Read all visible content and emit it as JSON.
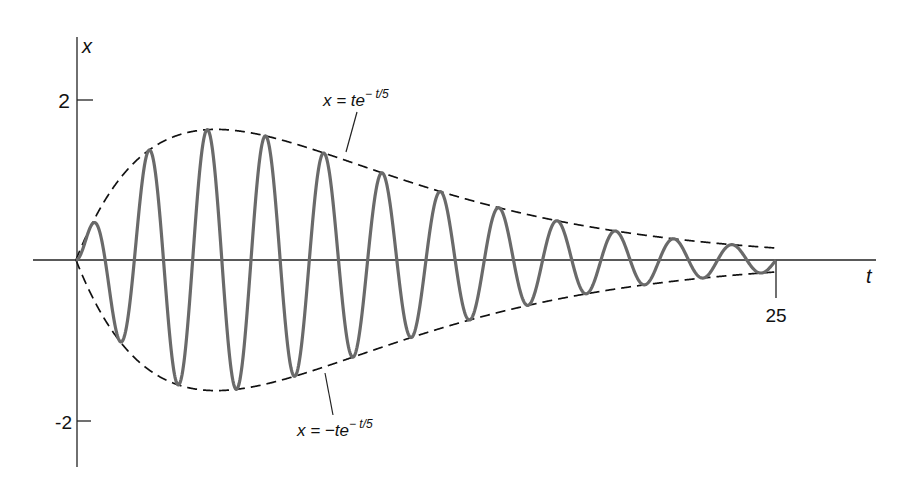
{
  "chart_data": {
    "type": "line",
    "title": "",
    "xlabel": "t",
    "ylabel": "x",
    "xlim": [
      0,
      25
    ],
    "ylim": [
      -2.6,
      2.9
    ],
    "grid": false,
    "x_ticks": [
      {
        "value": 25,
        "label": "25"
      }
    ],
    "y_ticks": [
      {
        "value": 2,
        "label": "2"
      },
      {
        "value": -2,
        "label": "-2"
      }
    ],
    "series": [
      {
        "name": "x(t)",
        "formula": "t e^(-t/5) sin(omega t)",
        "omega": 3.016,
        "style": "solid",
        "color": "#6a6a6a",
        "t_range": [
          0,
          25
        ],
        "peaks_approx": [
          {
            "t": 0.7,
            "x": 0.48
          },
          {
            "t": 2.6,
            "x": 1.52
          },
          {
            "t": 4.7,
            "x": 1.82
          },
          {
            "t": 6.8,
            "x": 1.75
          },
          {
            "t": 8.9,
            "x": 1.5
          },
          {
            "t": 11.0,
            "x": 1.21
          },
          {
            "t": 13.1,
            "x": 0.95
          },
          {
            "t": 15.2,
            "x": 0.73
          },
          {
            "t": 17.2,
            "x": 0.55
          },
          {
            "t": 19.3,
            "x": 0.41
          },
          {
            "t": 21.4,
            "x": 0.3
          },
          {
            "t": 23.5,
            "x": 0.22
          }
        ]
      },
      {
        "name": "upper envelope",
        "formula": "x = te^(-t/5)",
        "style": "dashed",
        "color": "#111111",
        "t_range": [
          0,
          25
        ]
      },
      {
        "name": "lower envelope",
        "formula": "x = -te^(-t/5)",
        "style": "dashed",
        "color": "#111111",
        "t_range": [
          0,
          25
        ]
      }
    ],
    "annotations": [
      {
        "text": "x = te^{-t/5}",
        "points_to": "upper envelope"
      },
      {
        "text": "x = -te^{-t/5}",
        "points_to": "lower envelope"
      }
    ]
  },
  "labels": {
    "y_axis": "x",
    "x_axis": "t",
    "tick_2": "2",
    "tick_neg2": "-2",
    "tick_25": "25",
    "upper_lhs": "x = te",
    "upper_exp": "− t/5",
    "lower_lhs": "x = −te",
    "lower_exp": "− t/5"
  },
  "layout": {
    "origin_px": [
      76,
      260
    ],
    "px_per_t": 28,
    "px_per_x": 71
  }
}
